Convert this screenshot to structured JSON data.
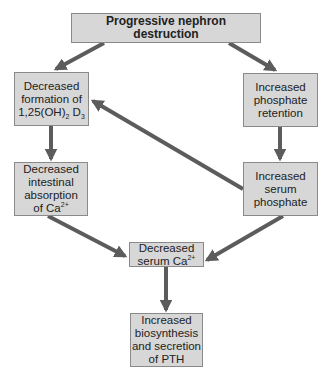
{
  "diagram": {
    "nodes": {
      "top": {
        "label": "Progressive nephron destruction"
      },
      "left1": {
        "lines": [
          "Decreased",
          "formation of"
        ],
        "formula_base": "1,25(OH)",
        "formula_sub1": "2",
        "formula_mid": " D",
        "formula_sub2": "3"
      },
      "right1": {
        "lines": [
          "Increased",
          "phosphate",
          "retention"
        ]
      },
      "left2": {
        "lines": [
          "Decreased",
          "intestinal",
          "absorption"
        ],
        "last_base": "of Ca",
        "last_sup": "2+"
      },
      "right2": {
        "lines": [
          "Increased",
          "serum",
          "phosphate"
        ]
      },
      "middle": {
        "lines": [
          "Decreased"
        ],
        "last_base": "serum Ca",
        "last_sup": "2+"
      },
      "bottom": {
        "lines": [
          "Increased",
          "biosynthesis",
          "and secretion",
          "of PTH"
        ]
      }
    },
    "edges": [
      {
        "from": "top",
        "to": "left1"
      },
      {
        "from": "top",
        "to": "right1"
      },
      {
        "from": "left1",
        "to": "left2"
      },
      {
        "from": "right1",
        "to": "right2"
      },
      {
        "from": "right2",
        "to": "left1"
      },
      {
        "from": "left2",
        "to": "middle"
      },
      {
        "from": "right2",
        "to": "middle"
      },
      {
        "from": "middle",
        "to": "bottom"
      }
    ],
    "colors": {
      "box_fill": "#d7d7d7",
      "box_border": "#8a8a8a",
      "arrow": "#5c5c5c"
    }
  }
}
